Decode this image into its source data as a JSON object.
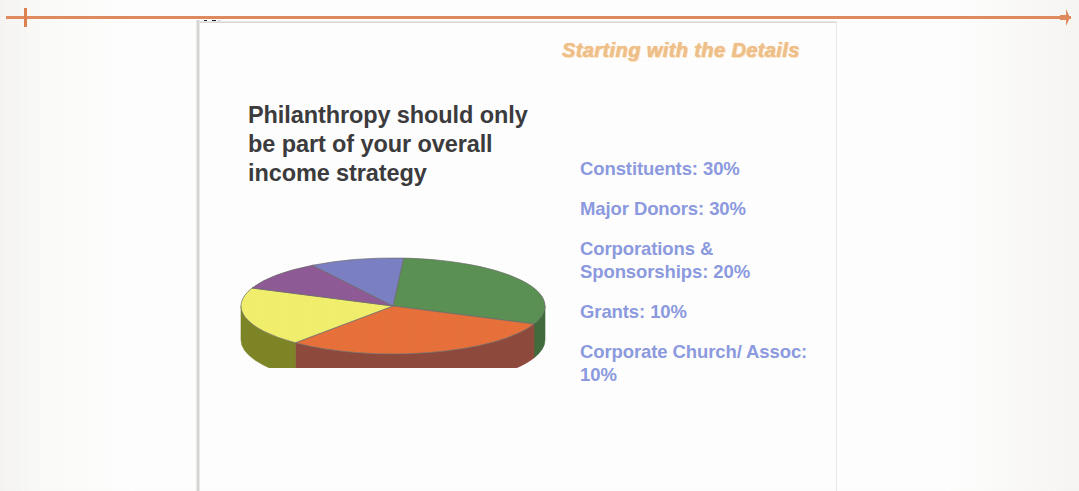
{
  "slide": {
    "title": "Starting with the Details",
    "heading": "Philanthropy should only be part of your overall income strategy",
    "title_color": "#f0c08a",
    "heading_color": "#3b3b3d",
    "legend_color": "#8c9ae0"
  },
  "legend": {
    "items": [
      {
        "label": "Constituents: 30%"
      },
      {
        "label": "Major Donors: 30%"
      },
      {
        "label": "Corporations & Sponsorships: 20%"
      },
      {
        "label": "Grants: 10%"
      },
      {
        "label": "Corporate Church/ Assoc: 10%"
      }
    ]
  },
  "chart_data": {
    "type": "pie",
    "title": "",
    "three_d": true,
    "labels": [
      "Constituents",
      "Major Donors",
      "Corporations & Sponsorships",
      "Grants",
      "Corporate Church/Assoc"
    ],
    "values": [
      30,
      30,
      20,
      10,
      10
    ],
    "value_suffix": "%",
    "colors": [
      "#5a9153",
      "#e8703a",
      "#f2ef6d",
      "#8f5a96",
      "#7b80c4"
    ],
    "side_colors": [
      "#416b3d",
      "#8e4a3c",
      "#7d8526",
      "#6b4470",
      "#5d6196"
    ],
    "legend_position": "right",
    "grid": false
  }
}
